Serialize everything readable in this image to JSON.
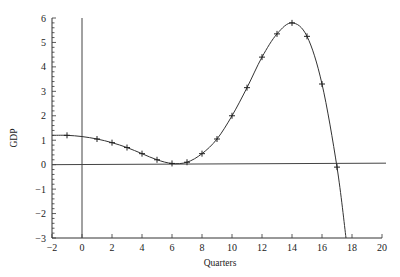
{
  "chart_data": {
    "type": "line",
    "title": "",
    "xlabel": "Quarters",
    "ylabel": "GDP",
    "xlim": [
      -2,
      20
    ],
    "ylim": [
      -3,
      6
    ],
    "x_ticks": [
      -2,
      0,
      2,
      4,
      6,
      8,
      10,
      12,
      14,
      16,
      18,
      20
    ],
    "y_ticks": [
      -3,
      -2,
      -1,
      0,
      1,
      2,
      3,
      4,
      5,
      6
    ],
    "grid": false,
    "legend": null,
    "reference_lines": [
      {
        "type": "horizontal",
        "y": 0
      },
      {
        "type": "vertical",
        "x": 0
      }
    ],
    "series": [
      {
        "name": "GDP",
        "marker": "+",
        "x": [
          -1,
          0,
          1,
          2,
          3,
          4,
          5,
          6,
          7,
          8,
          9,
          10,
          11,
          12,
          13,
          14,
          15,
          16,
          17
        ],
        "values": [
          1.2,
          1.15,
          1.05,
          0.9,
          0.7,
          0.45,
          0.2,
          0.05,
          0.1,
          0.45,
          1.05,
          2.0,
          3.15,
          4.4,
          5.35,
          5.8,
          5.25,
          3.3,
          -0.1
        ]
      }
    ],
    "curve_tail": {
      "x": 17.6,
      "y": -3
    }
  }
}
